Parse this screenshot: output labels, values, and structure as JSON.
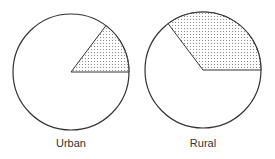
{
  "chart_data": {
    "type": "pie",
    "title": "",
    "charts": [
      {
        "name": "urban",
        "label": "Urban",
        "shaded_fraction": 0.15,
        "shaded_angle_deg": 53,
        "segments": [
          {
            "name": "shaded",
            "value": 15,
            "fill": "dotted"
          },
          {
            "name": "unshaded",
            "value": 85,
            "fill": "#ffffff"
          }
        ],
        "cx": 71,
        "cy": 72,
        "r": 58
      },
      {
        "name": "rural",
        "label": "Rural",
        "shaded_fraction": 0.35,
        "shaded_angle_deg": 127,
        "segments": [
          {
            "name": "shaded",
            "value": 35,
            "fill": "dotted"
          },
          {
            "name": "unshaded",
            "value": 65,
            "fill": "#ffffff"
          }
        ],
        "cx": 203,
        "cy": 70,
        "r": 58
      }
    ],
    "legend": "none",
    "colors": {
      "stroke": "#333333",
      "dots": "#777777",
      "background": "#ffffff"
    }
  },
  "labels": {
    "urban": "Urban",
    "rural": "Rural"
  }
}
